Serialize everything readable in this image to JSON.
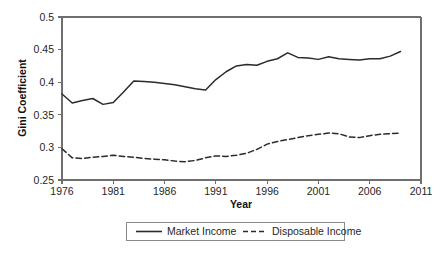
{
  "chart_data": {
    "type": "line",
    "title": "",
    "xlabel": "Year",
    "ylabel": "Gini Coefficient",
    "xlim": [
      1976,
      2011
    ],
    "ylim": [
      0.25,
      0.5
    ],
    "xticks": [
      1976,
      1981,
      1986,
      1991,
      1996,
      2001,
      2006,
      2011
    ],
    "yticks": [
      0.25,
      0.3,
      0.35,
      0.4,
      0.45,
      0.5
    ],
    "xtick_labels": [
      "1976",
      "1981",
      "1986",
      "1991",
      "1996",
      "2001",
      "2006",
      "2011"
    ],
    "ytick_labels": [
      "0.25",
      "0.3",
      "0.35",
      "0.4",
      "0.45",
      "0.5"
    ],
    "grid": false,
    "legend_position": "bottom-center",
    "x": [
      1976,
      1977,
      1978,
      1979,
      1980,
      1981,
      1982,
      1983,
      1984,
      1985,
      1986,
      1987,
      1988,
      1989,
      1990,
      1991,
      1992,
      1993,
      1994,
      1995,
      1996,
      1997,
      1998,
      1999,
      2000,
      2001,
      2002,
      2003,
      2004,
      2005,
      2006,
      2007,
      2008,
      2009
    ],
    "series": [
      {
        "name": "Market Income",
        "style": "solid",
        "color": "#2b2b2b",
        "values": [
          0.382,
          0.368,
          0.372,
          0.375,
          0.366,
          0.369,
          0.385,
          0.402,
          0.401,
          0.4,
          0.398,
          0.396,
          0.393,
          0.39,
          0.388,
          0.404,
          0.416,
          0.425,
          0.427,
          0.426,
          0.432,
          0.436,
          0.445,
          0.438,
          0.437,
          0.435,
          0.439,
          0.436,
          0.435,
          0.434,
          0.436,
          0.436,
          0.44,
          0.447
        ]
      },
      {
        "name": "Disposable Income",
        "style": "dashed",
        "color": "#2b2b2b",
        "values": [
          0.298,
          0.284,
          0.283,
          0.285,
          0.286,
          0.288,
          0.286,
          0.285,
          0.283,
          0.282,
          0.281,
          0.279,
          0.278,
          0.28,
          0.284,
          0.287,
          0.286,
          0.288,
          0.291,
          0.297,
          0.305,
          0.309,
          0.312,
          0.315,
          0.318,
          0.32,
          0.322,
          0.321,
          0.316,
          0.315,
          0.318,
          0.32,
          0.321,
          0.322
        ]
      }
    ]
  },
  "legend": {
    "items": [
      {
        "label": "Market Income"
      },
      {
        "label": "Disposable Income"
      }
    ]
  }
}
